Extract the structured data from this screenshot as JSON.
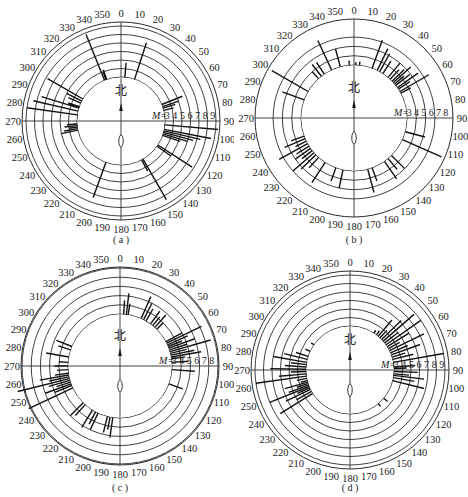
{
  "figure": {
    "north_label": "北",
    "m_prefix": "M=",
    "panels": [
      {
        "id": "a",
        "caption": "( a )",
        "cx": 121,
        "cy": 121,
        "outer_r": 99,
        "m_min": 3,
        "m_rings": [
          3,
          4,
          5,
          6,
          7,
          8,
          9
        ],
        "r_min": 44,
        "r_step": 8.5,
        "m_tick_labels": [
          "3",
          "4",
          "5",
          "6",
          "7",
          "8",
          "9"
        ]
      },
      {
        "id": "b",
        "caption": "( b )",
        "cx": 120,
        "cy": 118,
        "outer_r": 99,
        "m_min": 3,
        "m_rings": [
          3,
          4,
          5,
          6
        ],
        "r_min": 53,
        "r_step": 9.3,
        "m_tick_labels": [
          "3",
          "4",
          "5",
          "6",
          "7",
          "8"
        ]
      },
      {
        "id": "c",
        "caption": "( c )",
        "cx": 120,
        "cy": 118,
        "outer_r": 99,
        "m_min": 3,
        "m_rings": [
          3,
          4,
          5,
          6,
          7,
          8
        ],
        "r_min": 52,
        "r_step": 9.2,
        "m_tick_labels": [
          "3",
          "4",
          "5",
          "6",
          "7",
          "8"
        ]
      },
      {
        "id": "d",
        "caption": "( d )",
        "cx": 116,
        "cy": 122,
        "outer_r": 99,
        "m_min": 3,
        "m_rings": [
          3,
          4,
          5,
          6,
          7,
          8,
          9
        ],
        "r_min": 44,
        "r_step": 8.5,
        "m_tick_labels": [
          "3",
          "4",
          "5",
          "6",
          "7",
          "8",
          "9"
        ]
      }
    ]
  },
  "chart_data": [
    {
      "type": "polar-radial-lines",
      "title": "(a)",
      "angular_axis": {
        "unit": "degrees",
        "ticks": [
          0,
          10,
          20,
          30,
          40,
          50,
          60,
          70,
          80,
          90,
          100,
          110,
          120,
          130,
          140,
          150,
          160,
          170,
          180,
          190,
          200,
          210,
          220,
          230,
          240,
          250,
          260,
          270,
          280,
          290,
          300,
          310,
          320,
          330,
          340,
          350
        ],
        "zero": "north",
        "direction": "clockwise"
      },
      "radial_axis": {
        "label": "M",
        "range": [
          3,
          9
        ],
        "ticks": [
          3,
          4,
          5,
          6,
          7,
          8,
          9
        ]
      },
      "points": [
        [
          5,
          4.7
        ],
        [
          18,
          7.5
        ],
        [
          338,
          8.8
        ],
        [
          340,
          4.0
        ],
        [
          341,
          4.2
        ],
        [
          300,
          7.8
        ],
        [
          297,
          5.0
        ],
        [
          294,
          4.6
        ],
        [
          288,
          4.3
        ],
        [
          289,
          4.4
        ],
        [
          287,
          7.6
        ],
        [
          283,
          8.4
        ],
        [
          278,
          9.0
        ],
        [
          266,
          4.2
        ],
        [
          264,
          4.5
        ],
        [
          262,
          4.0
        ],
        [
          260,
          4.6
        ],
        [
          258,
          5.0
        ],
        [
          68,
          5.6
        ],
        [
          71,
          5.0
        ],
        [
          73,
          4.5
        ],
        [
          76,
          4.2
        ],
        [
          95,
          9.3
        ],
        [
          101,
          8.6
        ],
        [
          103,
          7.4
        ],
        [
          105,
          6.6
        ],
        [
          107,
          6.0
        ],
        [
          109,
          5.2
        ],
        [
          123,
          7.8
        ],
        [
          125,
          5.0
        ],
        [
          150,
          8.5
        ],
        [
          152,
          4.5
        ],
        [
          200,
          7.4
        ]
      ]
    },
    {
      "type": "polar-radial-lines",
      "title": "(b)",
      "angular_axis": {
        "unit": "degrees",
        "ticks": [
          0,
          10,
          20,
          30,
          40,
          50,
          60,
          70,
          80,
          90,
          100,
          110,
          120,
          130,
          140,
          150,
          160,
          170,
          180,
          190,
          200,
          210,
          220,
          230,
          240,
          250,
          260,
          270,
          280,
          290,
          300,
          310,
          320,
          330,
          340,
          350
        ],
        "zero": "north",
        "direction": "clockwise"
      },
      "radial_axis": {
        "label": "M",
        "range": [
          3,
          8
        ],
        "ticks": [
          3,
          4,
          5,
          6,
          7,
          8
        ]
      },
      "points": [
        [
          355,
          3.5
        ],
        [
          6,
          3.4
        ],
        [
          2,
          3.3
        ],
        [
          345,
          5.0
        ],
        [
          335,
          6.5
        ],
        [
          326,
          4.5
        ],
        [
          322,
          4.6
        ],
        [
          318,
          4.0
        ],
        [
          300,
          7.5
        ],
        [
          290,
          5.5
        ],
        [
          20,
          6.2
        ],
        [
          26,
          5.6
        ],
        [
          29,
          5.2
        ],
        [
          33,
          4.6
        ],
        [
          40,
          5.0
        ],
        [
          43,
          4.4
        ],
        [
          46,
          4.8
        ],
        [
          48,
          5.5
        ],
        [
          50,
          4.3
        ],
        [
          52,
          4.9
        ],
        [
          55,
          5.7
        ],
        [
          57,
          4.5
        ],
        [
          60,
          6.6
        ],
        [
          62,
          4.2
        ],
        [
          105,
          5.2
        ],
        [
          114,
          7.6
        ],
        [
          135,
          5.0
        ],
        [
          140,
          4.5
        ],
        [
          145,
          5.3
        ],
        [
          160,
          4.5
        ],
        [
          165,
          5.6
        ],
        [
          192,
          5.0
        ],
        [
          200,
          4.5
        ],
        [
          213,
          5.6
        ],
        [
          222,
          4.5
        ],
        [
          226,
          5.2
        ],
        [
          229,
          6.0
        ],
        [
          232,
          4.4
        ],
        [
          235,
          5.0
        ],
        [
          238,
          4.6
        ],
        [
          241,
          6.5
        ],
        [
          244,
          4.3
        ],
        [
          247,
          5.4
        ],
        [
          250,
          4.5
        ]
      ]
    },
    {
      "type": "polar-radial-lines",
      "title": "(c)",
      "angular_axis": {
        "unit": "degrees",
        "ticks": [
          0,
          10,
          20,
          30,
          40,
          50,
          60,
          70,
          80,
          90,
          100,
          110,
          120,
          130,
          140,
          150,
          160,
          170,
          180,
          190,
          200,
          210,
          220,
          230,
          240,
          250,
          260,
          270,
          280,
          290,
          300,
          310,
          320,
          330,
          340,
          350
        ],
        "zero": "north",
        "direction": "clockwise"
      },
      "radial_axis": {
        "label": "M",
        "range": [
          3,
          8
        ],
        "ticks": [
          3,
          4,
          5,
          6,
          7,
          8
        ]
      },
      "points": [
        [
          4,
          4.5
        ],
        [
          7,
          5.3
        ],
        [
          9,
          4.2
        ],
        [
          24,
          5.6
        ],
        [
          27,
          5.0
        ],
        [
          30,
          4.5
        ],
        [
          36,
          4.7
        ],
        [
          39,
          4.2
        ],
        [
          42,
          4.8
        ],
        [
          45,
          4.0
        ],
        [
          62,
          5.0
        ],
        [
          64,
          7.2
        ],
        [
          66,
          5.4
        ],
        [
          68,
          4.6
        ],
        [
          70,
          6.0
        ],
        [
          72,
          5.0
        ],
        [
          74,
          7.6
        ],
        [
          76,
          4.8
        ],
        [
          78,
          5.6
        ],
        [
          80,
          6.3
        ],
        [
          82,
          4.5
        ],
        [
          86,
          4.8
        ],
        [
          94,
          5.5
        ],
        [
          110,
          4.6
        ],
        [
          188,
          5.2
        ],
        [
          191,
          4.4
        ],
        [
          194,
          4.8
        ],
        [
          205,
          5.0
        ],
        [
          208,
          4.5
        ],
        [
          212,
          5.2
        ],
        [
          222,
          4.6
        ],
        [
          225,
          5.0
        ],
        [
          245,
          8.3
        ],
        [
          248,
          5.0
        ],
        [
          250,
          6.0
        ],
        [
          252,
          4.6
        ],
        [
          254,
          5.4
        ],
        [
          256,
          8.8
        ],
        [
          258,
          5.2
        ],
        [
          260,
          6.2
        ],
        [
          262,
          4.5
        ],
        [
          266,
          4.2
        ],
        [
          270,
          4.5
        ],
        [
          274,
          4.0
        ],
        [
          280,
          5.5
        ],
        [
          288,
          4.4
        ],
        [
          292,
          4.8
        ]
      ]
    },
    {
      "type": "polar-radial-lines",
      "title": "(d)",
      "angular_axis": {
        "unit": "degrees",
        "ticks": [
          0,
          10,
          20,
          30,
          40,
          50,
          60,
          70,
          80,
          90,
          100,
          110,
          120,
          130,
          140,
          150,
          160,
          170,
          180,
          190,
          200,
          210,
          220,
          230,
          240,
          250,
          260,
          270,
          280,
          290,
          300,
          310,
          320,
          330,
          340,
          350
        ],
        "zero": "north",
        "direction": "clockwise"
      },
      "radial_axis": {
        "label": "M",
        "range": [
          3,
          9
        ],
        "ticks": [
          3,
          4,
          5,
          6,
          7,
          8,
          9
        ]
      },
      "points": [
        [
          295,
          3.6
        ],
        [
          305,
          3.4
        ],
        [
          33,
          3.4
        ],
        [
          37,
          3.6
        ],
        [
          40,
          5.5
        ],
        [
          43,
          4.2
        ],
        [
          46,
          6.2
        ],
        [
          49,
          7.8
        ],
        [
          52,
          5.0
        ],
        [
          55,
          8.0
        ],
        [
          58,
          6.0
        ],
        [
          61,
          4.5
        ],
        [
          64,
          7.5
        ],
        [
          67,
          5.2
        ],
        [
          70,
          6.6
        ],
        [
          73,
          4.6
        ],
        [
          76,
          5.5
        ],
        [
          80,
          9.0
        ],
        [
          86,
          5.5
        ],
        [
          88,
          4.5
        ],
        [
          92,
          5.8
        ],
        [
          95,
          4.8
        ],
        [
          97,
          6.6
        ],
        [
          100,
          5.5
        ],
        [
          104,
          6.8
        ],
        [
          130,
          3.6
        ],
        [
          140,
          3.4
        ],
        [
          238,
          7.5
        ],
        [
          241,
          5.0
        ],
        [
          244,
          6.2
        ],
        [
          246,
          4.6
        ],
        [
          248,
          8.0
        ],
        [
          250,
          5.5
        ],
        [
          252,
          4.4
        ],
        [
          254,
          5.8
        ],
        [
          256,
          3.8
        ],
        [
          259,
          4.2
        ],
        [
          262,
          9.0
        ],
        [
          265,
          6.2
        ],
        [
          268,
          4.8
        ],
        [
          271,
          7.2
        ],
        [
          274,
          5.5
        ],
        [
          277,
          4.8
        ],
        [
          280,
          7.0
        ],
        [
          284,
          5.8
        ],
        [
          288,
          4.5
        ]
      ]
    }
  ]
}
